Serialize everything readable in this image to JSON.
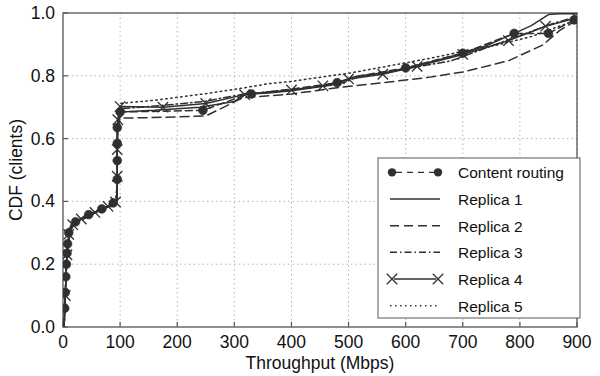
{
  "chart_data": {
    "type": "line",
    "title": "",
    "xlabel": "Throughput (Mbps)",
    "ylabel": "CDF (clients)",
    "xlim": [
      0,
      900
    ],
    "ylim": [
      0.0,
      1.0
    ],
    "xticks": [
      0,
      100,
      200,
      300,
      400,
      500,
      600,
      700,
      800,
      900
    ],
    "xtick_labels": [
      "0",
      "100",
      "200",
      "300",
      "400",
      "500",
      "600",
      "700",
      "800",
      "900"
    ],
    "yticks": [
      0.0,
      0.2,
      0.4,
      0.6,
      0.8,
      1.0
    ],
    "ytick_labels": [
      "0.0",
      "0.2",
      "0.4",
      "0.6",
      "0.8",
      "1.0"
    ],
    "grid": true,
    "grid_style": "dotted",
    "legend_position": "lower right",
    "colors": {
      "line": "#303030",
      "grid": "#b4b4b4",
      "axis": "#555555",
      "text": "#111111",
      "background": "#ffffff"
    },
    "series": [
      {
        "name": "Content routing",
        "style": "dashdot-marker",
        "marker": "filled-circle",
        "points": [
          [
            2,
            0.005
          ],
          [
            3,
            0.06
          ],
          [
            4,
            0.11
          ],
          [
            5,
            0.16
          ],
          [
            6,
            0.2
          ],
          [
            7,
            0.235
          ],
          [
            8,
            0.265
          ],
          [
            10,
            0.3
          ],
          [
            14,
            0.325
          ],
          [
            22,
            0.335
          ],
          [
            40,
            0.355
          ],
          [
            58,
            0.368
          ],
          [
            74,
            0.382
          ],
          [
            88,
            0.395
          ],
          [
            95,
            0.4
          ],
          [
            95,
            0.47
          ],
          [
            95,
            0.53
          ],
          [
            95,
            0.585
          ],
          [
            95,
            0.635
          ],
          [
            97,
            0.66
          ],
          [
            100,
            0.685
          ],
          [
            175,
            0.687
          ],
          [
            245,
            0.69
          ],
          [
            318,
            0.738
          ],
          [
            330,
            0.742
          ],
          [
            400,
            0.758
          ],
          [
            480,
            0.778
          ],
          [
            520,
            0.8
          ],
          [
            600,
            0.825
          ],
          [
            700,
            0.872
          ],
          [
            790,
            0.935
          ],
          [
            850,
            0.935
          ],
          [
            895,
            0.978
          ]
        ],
        "marker_points": [
          [
            3,
            0.06
          ],
          [
            4,
            0.11
          ],
          [
            5,
            0.16
          ],
          [
            6,
            0.2
          ],
          [
            7,
            0.235
          ],
          [
            8,
            0.265
          ],
          [
            10,
            0.3
          ],
          [
            22,
            0.335
          ],
          [
            45,
            0.358
          ],
          [
            68,
            0.376
          ],
          [
            88,
            0.395
          ],
          [
            95,
            0.47
          ],
          [
            95,
            0.53
          ],
          [
            95,
            0.585
          ],
          [
            95,
            0.635
          ],
          [
            100,
            0.685
          ],
          [
            245,
            0.69
          ],
          [
            330,
            0.742
          ],
          [
            480,
            0.778
          ],
          [
            600,
            0.825
          ],
          [
            700,
            0.872
          ],
          [
            790,
            0.935
          ],
          [
            850,
            0.935
          ],
          [
            895,
            0.978
          ]
        ]
      },
      {
        "name": "Replica 1",
        "style": "solid",
        "marker": "none",
        "points": [
          [
            2,
            0.005
          ],
          [
            4,
            0.1
          ],
          [
            6,
            0.19
          ],
          [
            8,
            0.255
          ],
          [
            11,
            0.3
          ],
          [
            16,
            0.325
          ],
          [
            30,
            0.342
          ],
          [
            55,
            0.365
          ],
          [
            78,
            0.383
          ],
          [
            92,
            0.398
          ],
          [
            95,
            0.41
          ],
          [
            95,
            0.52
          ],
          [
            95,
            0.61
          ],
          [
            96,
            0.655
          ],
          [
            100,
            0.685
          ],
          [
            160,
            0.69
          ],
          [
            240,
            0.7
          ],
          [
            300,
            0.718
          ],
          [
            318,
            0.742
          ],
          [
            360,
            0.745
          ],
          [
            400,
            0.752
          ],
          [
            450,
            0.765
          ],
          [
            480,
            0.775
          ],
          [
            505,
            0.795
          ],
          [
            520,
            0.8
          ],
          [
            560,
            0.808
          ],
          [
            610,
            0.828
          ],
          [
            660,
            0.852
          ],
          [
            700,
            0.872
          ],
          [
            740,
            0.895
          ],
          [
            790,
            0.935
          ],
          [
            820,
            0.96
          ],
          [
            850,
            0.995
          ],
          [
            870,
            0.998
          ],
          [
            900,
            0.998
          ]
        ]
      },
      {
        "name": "Replica 2",
        "style": "dashed",
        "marker": "none",
        "points": [
          [
            2,
            0.005
          ],
          [
            4,
            0.095
          ],
          [
            6,
            0.185
          ],
          [
            9,
            0.26
          ],
          [
            13,
            0.305
          ],
          [
            20,
            0.328
          ],
          [
            40,
            0.348
          ],
          [
            62,
            0.368
          ],
          [
            82,
            0.385
          ],
          [
            93,
            0.398
          ],
          [
            95,
            0.43
          ],
          [
            95,
            0.55
          ],
          [
            96,
            0.625
          ],
          [
            100,
            0.665
          ],
          [
            180,
            0.668
          ],
          [
            250,
            0.672
          ],
          [
            315,
            0.73
          ],
          [
            400,
            0.742
          ],
          [
            480,
            0.762
          ],
          [
            560,
            0.778
          ],
          [
            640,
            0.795
          ],
          [
            700,
            0.812
          ],
          [
            780,
            0.848
          ],
          [
            840,
            0.898
          ],
          [
            870,
            0.945
          ],
          [
            900,
            0.978
          ]
        ]
      },
      {
        "name": "Replica 3",
        "style": "dashdot",
        "marker": "none",
        "points": [
          [
            2,
            0.005
          ],
          [
            4,
            0.105
          ],
          [
            6,
            0.195
          ],
          [
            8,
            0.26
          ],
          [
            12,
            0.305
          ],
          [
            18,
            0.328
          ],
          [
            35,
            0.346
          ],
          [
            58,
            0.366
          ],
          [
            80,
            0.384
          ],
          [
            92,
            0.397
          ],
          [
            95,
            0.45
          ],
          [
            95,
            0.58
          ],
          [
            96,
            0.65
          ],
          [
            100,
            0.695
          ],
          [
            170,
            0.705
          ],
          [
            245,
            0.718
          ],
          [
            318,
            0.742
          ],
          [
            400,
            0.756
          ],
          [
            480,
            0.772
          ],
          [
            520,
            0.798
          ],
          [
            600,
            0.822
          ],
          [
            680,
            0.848
          ],
          [
            740,
            0.888
          ],
          [
            800,
            0.928
          ],
          [
            860,
            0.968
          ],
          [
            900,
            0.988
          ]
        ]
      },
      {
        "name": "Replica 4",
        "style": "solid-x",
        "marker": "x-cross",
        "points": [
          [
            2,
            0.005
          ],
          [
            4,
            0.1
          ],
          [
            6,
            0.19
          ],
          [
            8,
            0.255
          ],
          [
            11,
            0.302
          ],
          [
            17,
            0.326
          ],
          [
            32,
            0.344
          ],
          [
            56,
            0.365
          ],
          [
            79,
            0.384
          ],
          [
            92,
            0.398
          ],
          [
            95,
            0.42
          ],
          [
            95,
            0.53
          ],
          [
            95,
            0.615
          ],
          [
            96,
            0.66
          ],
          [
            100,
            0.702
          ],
          [
            175,
            0.7
          ],
          [
            250,
            0.712
          ],
          [
            318,
            0.74
          ],
          [
            400,
            0.755
          ],
          [
            455,
            0.768
          ],
          [
            500,
            0.79
          ],
          [
            560,
            0.805
          ],
          [
            620,
            0.83
          ],
          [
            700,
            0.868
          ],
          [
            780,
            0.912
          ],
          [
            845,
            0.958
          ],
          [
            900,
            0.985
          ]
        ],
        "marker_points": [
          [
            4,
            0.1
          ],
          [
            7,
            0.23
          ],
          [
            10,
            0.295
          ],
          [
            17,
            0.326
          ],
          [
            32,
            0.344
          ],
          [
            56,
            0.365
          ],
          [
            79,
            0.384
          ],
          [
            92,
            0.398
          ],
          [
            95,
            0.48
          ],
          [
            95,
            0.565
          ],
          [
            96,
            0.66
          ],
          [
            100,
            0.702
          ],
          [
            175,
            0.7
          ],
          [
            250,
            0.712
          ],
          [
            318,
            0.74
          ],
          [
            400,
            0.755
          ],
          [
            455,
            0.768
          ],
          [
            500,
            0.79
          ],
          [
            560,
            0.805
          ],
          [
            620,
            0.83
          ],
          [
            700,
            0.868
          ],
          [
            780,
            0.912
          ],
          [
            845,
            0.958
          ],
          [
            900,
            0.985
          ]
        ]
      },
      {
        "name": "Replica 5",
        "style": "dotted",
        "marker": "none",
        "points": [
          [
            2,
            0.005
          ],
          [
            4,
            0.105
          ],
          [
            6,
            0.2
          ],
          [
            8,
            0.262
          ],
          [
            12,
            0.308
          ],
          [
            18,
            0.33
          ],
          [
            35,
            0.348
          ],
          [
            58,
            0.368
          ],
          [
            80,
            0.386
          ],
          [
            92,
            0.399
          ],
          [
            95,
            0.46
          ],
          [
            95,
            0.6
          ],
          [
            97,
            0.672
          ],
          [
            100,
            0.712
          ],
          [
            160,
            0.722
          ],
          [
            245,
            0.742
          ],
          [
            318,
            0.762
          ],
          [
            360,
            0.775
          ],
          [
            400,
            0.782
          ],
          [
            460,
            0.798
          ],
          [
            500,
            0.808
          ],
          [
            560,
            0.828
          ],
          [
            620,
            0.848
          ],
          [
            660,
            0.862
          ],
          [
            700,
            0.878
          ],
          [
            760,
            0.898
          ],
          [
            820,
            0.925
          ],
          [
            860,
            0.952
          ],
          [
            900,
            0.978
          ]
        ]
      }
    ],
    "legend": [
      {
        "label": "Content routing",
        "style": "dashdot-marker"
      },
      {
        "label": "Replica 1",
        "style": "solid"
      },
      {
        "label": "Replica 2",
        "style": "dashed"
      },
      {
        "label": "Replica 3",
        "style": "dashdot"
      },
      {
        "label": "Replica 4",
        "style": "solid-x"
      },
      {
        "label": "Replica 5",
        "style": "dotted"
      }
    ]
  }
}
